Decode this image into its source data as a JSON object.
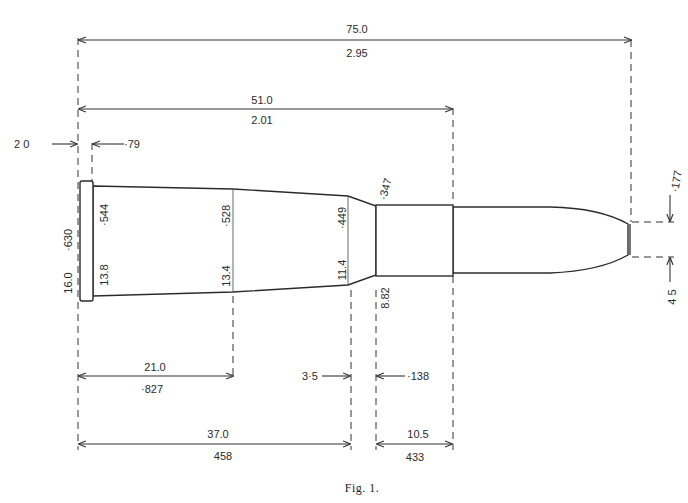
{
  "figure": {
    "caption": "Fig. 1."
  },
  "dimensions": {
    "overall_length": {
      "mm": "75.0",
      "in": "2.95"
    },
    "case_length": {
      "mm": "51.0",
      "in": "2.01"
    },
    "rim_thickness": {
      "mm": "2 0",
      "in": "·79"
    },
    "rim_diameter": {
      "mm": "16.0",
      "in": "·630"
    },
    "base_diameter": {
      "mm": "13.8",
      "in": "·544"
    },
    "body_mid_diameter": {
      "mm": "13.4",
      "in": "·528"
    },
    "shoulder_diameter": {
      "mm": "11.4",
      "in": "·449"
    },
    "neck_diameter": {
      "mm": "8.82",
      "in": "·347"
    },
    "bullet_tip_flat": {
      "mm": "4 5",
      "in": "·177"
    },
    "base_to_mid": {
      "mm": "21.0",
      "in": "·827"
    },
    "base_to_shoulder": {
      "mm": "37.0",
      "in": "458"
    },
    "shoulder_length": {
      "mm": "3·5",
      "in": "·138"
    },
    "neck_length": {
      "mm": "10.5",
      "in": "433"
    }
  }
}
